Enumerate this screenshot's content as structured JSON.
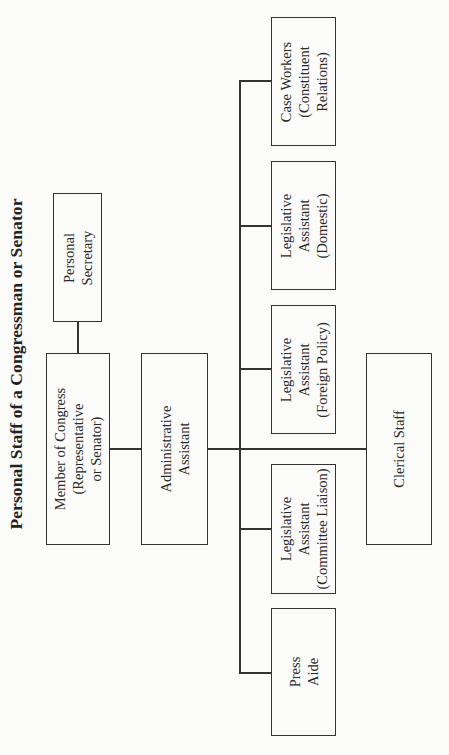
{
  "title": "Personal Staff of a Congressman or Senator",
  "colors": {
    "background": "#fbfbf9",
    "line": "#333333",
    "text": "#2a2a2a"
  },
  "orientation": "rotated -90deg (landscape chart on portrait page)",
  "nodes": {
    "personal_secretary": {
      "lines": [
        "Personal",
        "Secretary"
      ]
    },
    "member_of_congress": {
      "lines": [
        "Member of Congress",
        "(Representative",
        "or Senator)"
      ]
    },
    "administrative_assistant": {
      "lines": [
        "Administrative",
        "Assistant"
      ]
    },
    "clerical_staff": {
      "lines": [
        "Clerical Staff"
      ]
    },
    "case_workers": {
      "lines": [
        "Case Workers",
        "(Constituent",
        "Relations)"
      ]
    },
    "legislative_domestic": {
      "lines": [
        "Legislative",
        "Assistant",
        "(Domestic)"
      ]
    },
    "legislative_foreign": {
      "lines": [
        "Legislative",
        "Assistant",
        "(Foreign Policy)"
      ]
    },
    "legislative_committee": {
      "lines": [
        "Legislative",
        "Assistant",
        "(Committee Liaison)"
      ]
    },
    "press_aide": {
      "lines": [
        "Press",
        "Aide"
      ]
    }
  },
  "edges": [
    [
      "member_of_congress",
      "personal_secretary"
    ],
    [
      "member_of_congress",
      "administrative_assistant"
    ],
    [
      "administrative_assistant",
      "clerical_staff"
    ],
    [
      "administrative_assistant",
      "case_workers"
    ],
    [
      "administrative_assistant",
      "legislative_domestic"
    ],
    [
      "administrative_assistant",
      "legislative_foreign"
    ],
    [
      "administrative_assistant",
      "legislative_committee"
    ],
    [
      "administrative_assistant",
      "press_aide"
    ]
  ]
}
